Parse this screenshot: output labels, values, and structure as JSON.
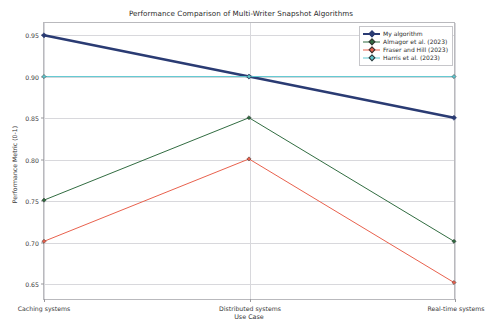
{
  "chart_data": {
    "type": "line",
    "title": "Performance Comparison of Multi-Writer Snapshot Algorithms",
    "xlabel": "Use Case",
    "ylabel": "Performance Metric (0-1)",
    "categories": [
      "Caching systems",
      "Distributed systems",
      "Real-time systems"
    ],
    "yticks": [
      "0.65",
      "0.70",
      "0.75",
      "0.80",
      "0.85",
      "0.90",
      "0.95"
    ],
    "ylim": [
      0.63,
      0.965
    ],
    "grid": true,
    "legend_position": "upper right",
    "series": [
      {
        "name": "My algorithm",
        "values": [
          0.95,
          0.9,
          0.85
        ],
        "color": "#2a3b73",
        "linewidth": 2.6,
        "marker": "diamond"
      },
      {
        "name": "Almagor et al. (2023)",
        "values": [
          0.75,
          0.85,
          0.7
        ],
        "color": "#2f6b3f",
        "linewidth": 1.0,
        "marker": "diamond"
      },
      {
        "name": "Fraser and Hill (2023)",
        "values": [
          0.7,
          0.8,
          0.65
        ],
        "color": "#e8604c",
        "linewidth": 1.0,
        "marker": "diamond"
      },
      {
        "name": "Harris et al. (2023)",
        "values": [
          0.9,
          0.9,
          0.9
        ],
        "color": "#5ec8d0",
        "linewidth": 1.0,
        "marker": "diamond"
      }
    ]
  }
}
